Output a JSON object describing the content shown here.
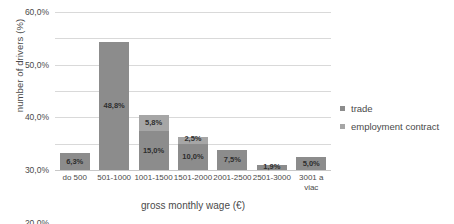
{
  "chart_data": {
    "type": "bar",
    "subtype": "stacked-bar",
    "title": "",
    "xlabel": "gross monthly wage (€)",
    "ylabel": "number of drivers (%)",
    "categories": [
      "do 500",
      "501-1000",
      "1001-1500",
      "1501-2000",
      "2001-2500",
      "2501-3000",
      "3001 a viac"
    ],
    "category_labels_display": [
      "do 500",
      "501-1000",
      "1001-1500",
      "1501-2000",
      "2001-2500",
      "2501-3000",
      "3001 a\nviac"
    ],
    "ylim": [
      0,
      60
    ],
    "ytick_labels": [
      "60,0%",
      "50,0%",
      "40,0%",
      "30,0%",
      "20,0%",
      "10,0%",
      "0,0%"
    ],
    "ytick_values": [
      60,
      50,
      40,
      30,
      20,
      10,
      0
    ],
    "grid": true,
    "legend_position": "right",
    "series": [
      {
        "name": "trade",
        "color": "#8c8c8c",
        "values": [
          6.3,
          48.8,
          15.0,
          10.0,
          7.5,
          1.9,
          5.0
        ],
        "labels": [
          "6,3%",
          "48,8%",
          "15,0%",
          "10,0%",
          "7,5%",
          "1,9%",
          "5,0%"
        ]
      },
      {
        "name": "employment contract",
        "color": "#a6a6a6",
        "values": [
          0,
          0,
          5.8,
          2.5,
          0,
          0,
          0
        ],
        "labels": [
          "",
          "",
          "5,8%",
          "2,5%",
          "",
          "",
          ""
        ]
      }
    ]
  },
  "legend": {
    "items": [
      {
        "label": "trade",
        "color": "#8c8c8c"
      },
      {
        "label": "employment contract",
        "color": "#a6a6a6"
      }
    ]
  }
}
